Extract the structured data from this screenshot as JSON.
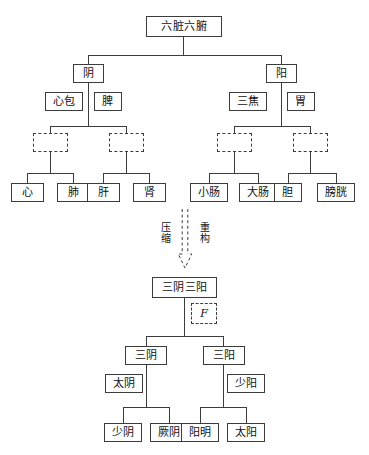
{
  "diagram": {
    "title_top": "六脏六腑",
    "title_bottom": "三阴三阳",
    "transform": {
      "label_left": "压缩",
      "label_right": "重构",
      "arrow_style": "dashed-outline-down-arrow",
      "function_symbol": "F"
    },
    "colors": {
      "line": "#3c3c3c",
      "text": "#111111",
      "background": "#ffffff"
    },
    "top_tree": {
      "root": "六脏六腑",
      "branches": [
        {
          "label": "阴",
          "side_nodes": [
            "心包",
            "脾"
          ],
          "groups": [
            {
              "hidden": "",
              "leaves": [
                "心",
                "肺"
              ]
            },
            {
              "hidden": "",
              "leaves": [
                "肝",
                "肾"
              ]
            }
          ]
        },
        {
          "label": "阳",
          "side_nodes": [
            "三焦",
            "胃"
          ],
          "groups": [
            {
              "hidden": "",
              "leaves": [
                "小肠",
                "大肠"
              ]
            },
            {
              "hidden": "",
              "leaves": [
                "胆",
                "膀胱"
              ]
            }
          ]
        }
      ]
    },
    "bottom_tree": {
      "root": "三阴三阳",
      "branches": [
        {
          "label": "三阴",
          "side_node": "太阴",
          "leaves": [
            "少阴",
            "厥阴"
          ]
        },
        {
          "label": "三阳",
          "side_node": "少阳",
          "leaves": [
            "阳明",
            "太阳"
          ]
        }
      ]
    }
  }
}
